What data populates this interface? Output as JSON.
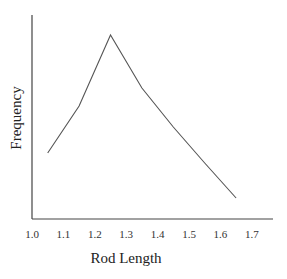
{
  "chart_data": {
    "type": "line",
    "title": "",
    "xlabel": "Rod Length",
    "ylabel": "Frequency",
    "x_ticks": [
      "1.0",
      "1.1",
      "1.2",
      "1.3",
      "1.4",
      "1.5",
      "1.6",
      "1.7"
    ],
    "xlim": [
      1.0,
      1.75
    ],
    "y_ticks": [],
    "ylim": [
      0,
      204
    ],
    "grid": false,
    "legend": null,
    "series": [
      {
        "name": "Frequency",
        "x": [
          1.05,
          1.15,
          1.25,
          1.35,
          1.45,
          1.55,
          1.65
        ],
        "values": [
          66,
          113,
          184,
          131,
          92,
          56,
          21
        ],
        "color": "#555555"
      }
    ]
  }
}
